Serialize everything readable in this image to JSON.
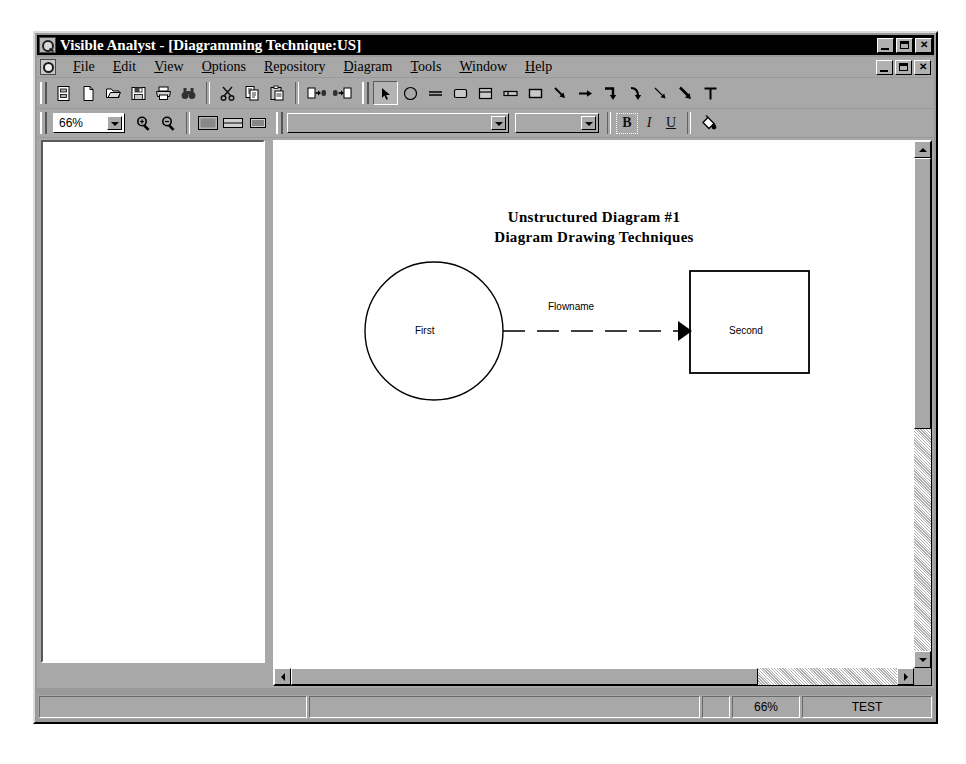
{
  "window": {
    "app_title": "Visible Analyst - [Diagramming Technique:US]",
    "icon": "analyst-icon",
    "minimize_label": "_",
    "restore_label": "□",
    "close_label": "✕"
  },
  "menubar": {
    "doc_icon": "document-control-icon",
    "items": [
      {
        "label": "File",
        "mnemonic": "F"
      },
      {
        "label": "Edit",
        "mnemonic": "E"
      },
      {
        "label": "View",
        "mnemonic": "V"
      },
      {
        "label": "Options",
        "mnemonic": "O"
      },
      {
        "label": "Repository",
        "mnemonic": "R"
      },
      {
        "label": "Diagram",
        "mnemonic": "D"
      },
      {
        "label": "Tools",
        "mnemonic": "T"
      },
      {
        "label": "Window",
        "mnemonic": "W"
      },
      {
        "label": "Help",
        "mnemonic": "H"
      }
    ],
    "child_minimize_label": "_",
    "child_restore_label": "□",
    "child_close_label": "✕"
  },
  "toolbar_main": {
    "groups": [
      [
        "project-icon",
        "new-file-icon",
        "open-folder-icon",
        "save-disk-icon",
        "print-icon",
        "find-binoculars-icon"
      ],
      [
        "cut-scissors-icon",
        "copy-icon",
        "paste-icon"
      ],
      [
        "nudge-right-icon",
        "nudge-left-icon"
      ]
    ]
  },
  "toolbar_draw": {
    "tools": [
      {
        "name": "select-arrow-tool",
        "selected": true
      },
      {
        "name": "circle-tool",
        "selected": false
      },
      {
        "name": "line-tool",
        "selected": false
      },
      {
        "name": "rounded-box-tool",
        "selected": false
      },
      {
        "name": "divided-box-tool",
        "selected": false
      },
      {
        "name": "entity-box-tool",
        "selected": false
      },
      {
        "name": "rectangle-tool",
        "selected": false
      },
      {
        "name": "elbow-arrow-tool",
        "selected": false
      },
      {
        "name": "straight-arrow-tool",
        "selected": false
      },
      {
        "name": "corner-arrow-tool",
        "selected": false
      },
      {
        "name": "curve-arrow-tool",
        "selected": false
      },
      {
        "name": "thin-arrow-tool",
        "selected": false
      },
      {
        "name": "bold-arrow-tool",
        "selected": false
      },
      {
        "name": "text-tool",
        "selected": false
      }
    ]
  },
  "toolbar_format": {
    "zoom_value": "66%",
    "zoom_options": [
      "25%",
      "50%",
      "66%",
      "75%",
      "100%",
      "150%",
      "200%"
    ],
    "zoom_in_icon": "zoom-in-icon",
    "zoom_out_icon": "zoom-out-icon",
    "view_buttons": [
      "view-full-icon",
      "view-split-icon",
      "view-list-icon"
    ],
    "font_name_value": "",
    "font_name_placeholder": "",
    "font_size_value": "",
    "font_size_placeholder": "",
    "bold_label": "B",
    "italic_label": "I",
    "underline_label": "U",
    "fill_color_icon": "paint-bucket-icon"
  },
  "left_pane": {
    "name": "project-explorer-pane",
    "content": ""
  },
  "diagram": {
    "title_line1": "Unstructured Diagram #1",
    "title_line2": "Diagram Drawing Techniques",
    "nodes": [
      {
        "id": "first",
        "shape": "circle",
        "label": "First"
      },
      {
        "id": "second",
        "shape": "rectangle",
        "label": "Second"
      }
    ],
    "flows": [
      {
        "id": "flow1",
        "label": "Flowname",
        "from": "first",
        "to": "second",
        "style": "dashed",
        "arrowhead": "solid-triangle"
      }
    ]
  },
  "scrollbars": {
    "vertical_thumb_percent": 55,
    "horizontal_thumb_percent": 77
  },
  "statusbar": {
    "message": "",
    "hint": "",
    "small": "",
    "zoom": "66%",
    "mode": "TEST"
  },
  "colors": {
    "titlebar": "#000000",
    "face": "#a8a8a8",
    "window_bg": "#9a9a9a",
    "canvas": "#ffffff",
    "ink": "#000000"
  }
}
